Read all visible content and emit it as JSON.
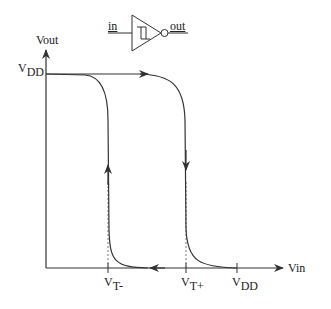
{
  "symbol": {
    "input_label": "in",
    "output_label": "out",
    "type": "schmitt-trigger-inverter"
  },
  "axes": {
    "y_label": "Vout",
    "x_label": "Vin",
    "y_tick": {
      "main": "V",
      "sub": "DD"
    }
  },
  "x_ticks": [
    {
      "main": "V",
      "sub": "T-"
    },
    {
      "main": "V",
      "sub": "T+"
    },
    {
      "main": "V",
      "sub": "DD"
    }
  ],
  "colors": {
    "stroke": "#333333",
    "background": "#ffffff"
  }
}
